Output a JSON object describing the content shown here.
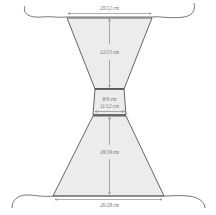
{
  "diagram": {
    "type": "schematic",
    "colors": {
      "fill": "#ececec",
      "outline": "#555555",
      "dimension_line": "#777777",
      "text": "#6a6a6a"
    },
    "measurements": {
      "top_width": "20/22 cm",
      "upper_length": "12/15 cm",
      "waist_height": "8/9 cm",
      "waist_width": "11/12 cm",
      "lower_length": "18/19 cm",
      "bottom_width": "26/28 cm"
    }
  }
}
